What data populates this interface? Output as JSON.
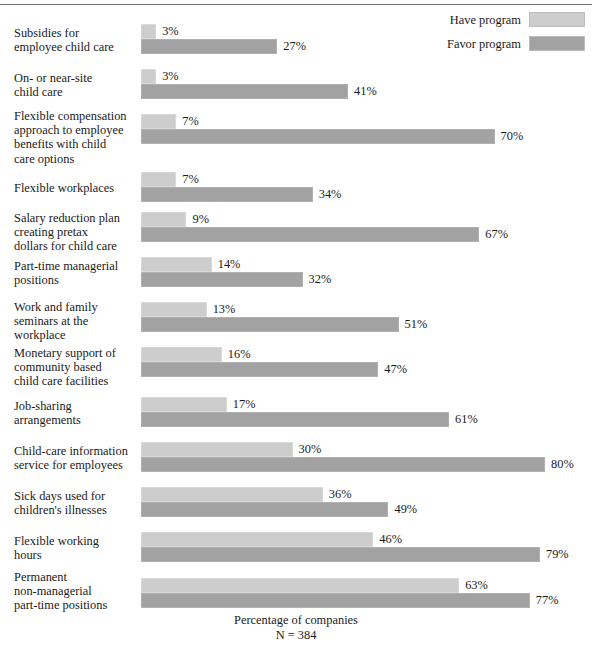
{
  "chart_data": {
    "type": "bar",
    "orientation": "horizontal",
    "title": "",
    "xlabel": "Percentage of companies",
    "ylabel": "",
    "note": "N = 384",
    "xlim": [
      0,
      100
    ],
    "grid": false,
    "legend_position": "top-right",
    "categories": [
      "Subsidies for employee child care",
      "On- or near-site child care",
      "Flexible compensation approach to employee benefits with child care options",
      "Flexible workplaces",
      "Salary reduction plan creating pretax dollars for child care",
      "Part-time managerial positions",
      "Work and family seminars at the workplace",
      "Monetary support of community based child care facilities",
      "Job-sharing arrangements",
      "Child-care information service for employees",
      "Sick days used for children's illnesses",
      "Flexible working hours",
      "Permanent non-managerial part-time positions"
    ],
    "series": [
      {
        "name": "Have program",
        "color": "#cdcdcd",
        "values": [
          3,
          3,
          7,
          7,
          9,
          14,
          13,
          16,
          17,
          30,
          36,
          46,
          63
        ]
      },
      {
        "name": "Favor program",
        "color": "#a2a2a2",
        "values": [
          27,
          41,
          70,
          34,
          67,
          32,
          51,
          47,
          61,
          80,
          49,
          79,
          77
        ]
      }
    ],
    "value_labels": {
      "have": [
        "3%",
        "3%",
        "7%",
        "7%",
        "9%",
        "14%",
        "13%",
        "16%",
        "17%",
        "30%",
        "36%",
        "46%",
        "63%"
      ],
      "favor": [
        "27%",
        "41%",
        "70%",
        "34%",
        "67%",
        "32%",
        "51%",
        "47%",
        "61%",
        "80%",
        "49%",
        "79%",
        "77%"
      ]
    }
  },
  "legend": {
    "items": [
      {
        "label": "Have program",
        "swatch": "#cdcdcd"
      },
      {
        "label": "Favor program",
        "swatch": "#a2a2a2"
      }
    ]
  },
  "rows": [
    {
      "label_lines": [
        "Subsidies for",
        "employee child care"
      ],
      "have": 3,
      "have_label": "3%",
      "favor": 27,
      "favor_label": "27%",
      "top": 24,
      "label_top": 26
    },
    {
      "label_lines": [
        "On- or near-site",
        "child care"
      ],
      "have": 3,
      "have_label": "3%",
      "favor": 41,
      "favor_label": "41%",
      "top": 69,
      "label_top": 71
    },
    {
      "label_lines": [
        "Flexible compensation",
        "approach to employee",
        "benefits with child",
        "care options"
      ],
      "have": 7,
      "have_label": "7%",
      "favor": 70,
      "favor_label": "70%",
      "top": 114,
      "label_top": 109
    },
    {
      "label_lines": [
        "Flexible workplaces"
      ],
      "have": 7,
      "have_label": "7%",
      "favor": 34,
      "favor_label": "34%",
      "top": 172,
      "label_top": 181
    },
    {
      "label_lines": [
        "Salary reduction plan",
        "creating pretax",
        "dollars for child care"
      ],
      "have": 9,
      "have_label": "9%",
      "favor": 67,
      "favor_label": "67%",
      "top": 212,
      "label_top": 211
    },
    {
      "label_lines": [
        "Part-time managerial",
        "positions"
      ],
      "have": 14,
      "have_label": "14%",
      "favor": 32,
      "favor_label": "32%",
      "top": 257,
      "label_top": 259
    },
    {
      "label_lines": [
        "Work and family",
        "seminars at the",
        "workplace"
      ],
      "have": 13,
      "have_label": "13%",
      "favor": 51,
      "favor_label": "51%",
      "top": 302,
      "label_top": 300
    },
    {
      "label_lines": [
        "Monetary support of",
        "community based",
        "child care facilities"
      ],
      "have": 16,
      "have_label": "16%",
      "favor": 47,
      "favor_label": "47%",
      "top": 347,
      "label_top": 346
    },
    {
      "label_lines": [
        "Job-sharing",
        "arrangements"
      ],
      "have": 17,
      "have_label": "17%",
      "favor": 61,
      "favor_label": "61%",
      "top": 397,
      "label_top": 399
    },
    {
      "label_lines": [
        "Child-care information",
        "service for employees"
      ],
      "have": 30,
      "have_label": "30%",
      "favor": 80,
      "favor_label": "80%",
      "top": 442,
      "label_top": 444
    },
    {
      "label_lines": [
        "Sick days used for",
        "children's illnesses"
      ],
      "have": 36,
      "have_label": "36%",
      "favor": 49,
      "favor_label": "49%",
      "top": 487,
      "label_top": 489
    },
    {
      "label_lines": [
        "Flexible working",
        "hours"
      ],
      "have": 46,
      "have_label": "46%",
      "favor": 79,
      "favor_label": "79%",
      "top": 532,
      "label_top": 534
    },
    {
      "label_lines": [
        "Permanent",
        "non-managerial",
        "part-time positions"
      ],
      "have": 63,
      "have_label": "63%",
      "favor": 77,
      "favor_label": "77%",
      "top": 578,
      "label_top": 570
    }
  ],
  "footer": {
    "axis_title": "Percentage of companies",
    "sample_size": "N = 384"
  }
}
